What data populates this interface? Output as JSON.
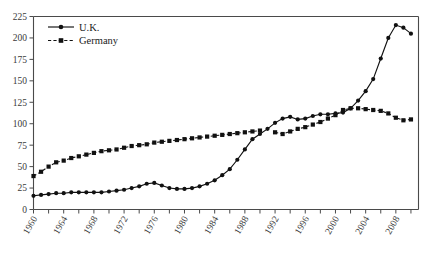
{
  "chart_data": {
    "type": "line",
    "title": "",
    "subtitle": "",
    "xlabel": "",
    "ylabel": "",
    "xlim": [
      1960,
      2011
    ],
    "ylim": [
      0,
      225
    ],
    "grid": false,
    "legend_position": "top-left",
    "y_ticks": [
      0,
      25,
      50,
      75,
      100,
      125,
      150,
      175,
      200,
      225
    ],
    "y_tick_labels": [
      "0",
      "25",
      "50",
      "75",
      "100",
      "125",
      "150",
      "175",
      "200",
      "225"
    ],
    "x_ticks": [
      1960,
      1962,
      1964,
      1966,
      1968,
      1970,
      1972,
      1974,
      1976,
      1978,
      1980,
      1982,
      1984,
      1986,
      1988,
      1990,
      1992,
      1994,
      1996,
      1998,
      2000,
      2002,
      2004,
      2006,
      2008,
      2010
    ],
    "x_tick_labels": [
      "1960",
      "1964",
      "1968",
      "1972",
      "1976",
      "1980",
      "1984",
      "1988",
      "1992",
      "1996",
      "2000",
      "2004",
      "2008"
    ],
    "x_labeled_ticks": [
      1960,
      1964,
      1968,
      1972,
      1976,
      1980,
      1984,
      1988,
      1992,
      1996,
      2000,
      2004,
      2008
    ],
    "series": [
      {
        "name": "U.K.",
        "marker": "circle",
        "linestyle": "solid",
        "color": "#111111",
        "x": [
          1960,
          1961,
          1962,
          1963,
          1964,
          1965,
          1966,
          1967,
          1968,
          1969,
          1970,
          1971,
          1972,
          1973,
          1974,
          1975,
          1976,
          1977,
          1978,
          1979,
          1980,
          1981,
          1982,
          1983,
          1984,
          1985,
          1986,
          1987,
          1988,
          1989,
          1990,
          1991,
          1992,
          1993,
          1994,
          1995,
          1996,
          1997,
          1998,
          1999,
          2000,
          2001,
          2002,
          2003,
          2004,
          2005,
          2006,
          2007,
          2008,
          2009,
          2010
        ],
        "values": [
          16,
          17,
          18,
          19,
          19,
          20,
          20,
          20,
          20,
          20,
          21,
          22,
          23,
          25,
          27,
          30,
          31,
          28,
          25,
          24,
          24,
          25,
          27,
          30,
          34,
          40,
          47,
          58,
          70,
          82,
          88,
          94,
          101,
          106,
          108,
          105,
          106,
          109,
          111,
          111,
          112,
          113,
          118,
          127,
          138,
          152,
          176,
          200,
          215,
          212,
          205
        ]
      },
      {
        "name": "Germany",
        "marker": "square",
        "linestyle": "dashed",
        "color": "#111111",
        "x": [
          1960,
          1961,
          1962,
          1963,
          1964,
          1965,
          1966,
          1967,
          1968,
          1969,
          1970,
          1971,
          1972,
          1973,
          1974,
          1975,
          1976,
          1977,
          1978,
          1979,
          1980,
          1981,
          1982,
          1983,
          1984,
          1985,
          1986,
          1987,
          1988,
          1989,
          1990,
          1992,
          1993,
          1994,
          1995,
          1996,
          1997,
          1998,
          1999,
          2000,
          2001,
          2002,
          2003,
          2004,
          2005,
          2006,
          2007,
          2008,
          2009,
          2010
        ],
        "values": [
          39,
          44,
          50,
          55,
          57,
          60,
          62,
          64,
          66,
          68,
          69,
          70,
          72,
          74,
          75,
          76,
          78,
          79,
          80,
          81,
          82,
          83,
          84,
          85,
          86,
          87,
          88,
          89,
          90,
          91,
          92,
          90,
          88,
          91,
          94,
          96,
          99,
          102,
          106,
          110,
          116,
          118,
          118,
          117,
          116,
          115,
          112,
          107,
          104,
          105
        ]
      }
    ]
  },
  "legend": {
    "entries": [
      {
        "label": "U.K.",
        "marker": "circle",
        "linestyle": "solid"
      },
      {
        "label": "Germany",
        "marker": "square",
        "linestyle": "dashed"
      }
    ]
  }
}
